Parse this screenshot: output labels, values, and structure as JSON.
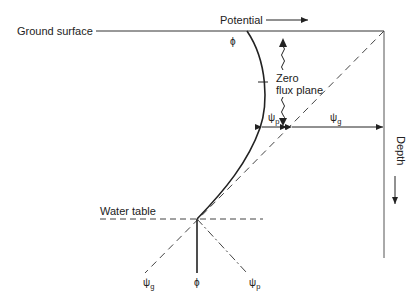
{
  "diagram": {
    "labels": {
      "ground_surface": "Ground surface",
      "potential": "Potential",
      "depth": "Depth",
      "zero_flux_line1": "Zero",
      "zero_flux_line2": "flux plane",
      "water_table": "Water table",
      "phi_top": "ϕ",
      "phi_bottom": "ϕ",
      "psi_p_mid": "ψ",
      "psi_p_mid_sub": "p",
      "psi_g_mid": "ψ",
      "psi_g_mid_sub": "g",
      "psi_g_bottom": "ψ",
      "psi_g_bottom_sub": "g",
      "psi_p_bottom": "ψ",
      "psi_p_bottom_sub": "p"
    },
    "colors": {
      "line": "#222222",
      "dashed": "#444444",
      "background": "#ffffff"
    }
  }
}
